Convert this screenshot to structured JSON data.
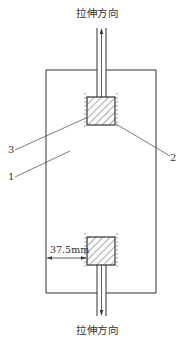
{
  "diagram": {
    "top_label": "拉伸方向",
    "bottom_label": "拉伸方向",
    "dimension_label": "37.5mm",
    "callouts": [
      {
        "id": "1",
        "label": "1"
      },
      {
        "id": "2",
        "label": "2"
      },
      {
        "id": "3",
        "label": "3"
      }
    ],
    "colors": {
      "line": "#333333",
      "hatch": "#555555",
      "background": "#ffffff"
    }
  }
}
